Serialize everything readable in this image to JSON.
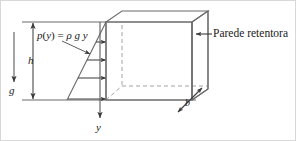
{
  "figure": {
    "labels": {
      "pressure_formula": {
        "p": "p",
        "open": "(",
        "y1": "y",
        "close": ")",
        "equals": " = ",
        "rho": "ρ",
        "space1": " ",
        "g": "g",
        "space2": " ",
        "y2": "y",
        "full": "p(y) = ρ g y"
      },
      "depth": "h",
      "gravity": "g",
      "y_axis": "y",
      "thickness": "b",
      "wall": "Parede retentora"
    },
    "colors": {
      "line": "#6b6b6b",
      "dark_line": "#4a4a4a",
      "dashed": "#9a9a9a",
      "text": "#1a1a1a",
      "background": "#ffffff",
      "border": "#cfcfcf"
    },
    "geometry": {
      "water_surface_y": 22,
      "ground_y": 100,
      "wall_front_x": 106,
      "wall_back_x": 122,
      "wall_right_front_x": 192,
      "wall_right_back_x": 208,
      "box_top_back_y": 11,
      "pressure_triangle_base_x": 67,
      "arrow_count": 4
    }
  }
}
